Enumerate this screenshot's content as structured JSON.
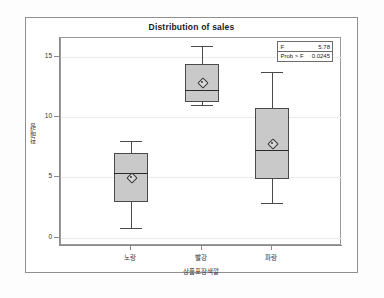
{
  "chart_data": {
    "type": "box",
    "title": "Distribution of sales",
    "xlabel": "상품포장색깔",
    "ylabel": "판매량",
    "ylim": [
      -0.7,
      16.6
    ],
    "yticks": [
      0,
      5,
      10,
      15
    ],
    "ytick_labels": [
      "0",
      "5",
      "10",
      "15"
    ],
    "grid": true,
    "legend_position": "top-right",
    "categories": [
      "노랑",
      "빨강",
      "파랑"
    ],
    "boxes": [
      {
        "category": "노랑",
        "min": 0.8,
        "q1": 3.0,
        "median": 5.4,
        "mean": 5.0,
        "q3": 7.0,
        "max": 8.0
      },
      {
        "category": "빨강",
        "min": 11.0,
        "q1": 11.3,
        "median": 12.3,
        "mean": 12.9,
        "q3": 14.4,
        "max": 15.9
      },
      {
        "category": "파랑",
        "min": 2.9,
        "q1": 4.9,
        "median": 7.3,
        "mean": 7.9,
        "q3": 10.8,
        "max": 13.8
      }
    ],
    "annotations": [
      {
        "key": "F",
        "value": "5.78"
      },
      {
        "key": "Prob > F",
        "value": "0.0245"
      }
    ],
    "colors": {
      "box_fill": "#c9c9c9",
      "box_edge": "#4a4a4a",
      "median": "#2b2b2b",
      "grid": "#ececec",
      "axis": "#8a8a8a",
      "background": "#ffffff",
      "text": "#333333"
    }
  }
}
